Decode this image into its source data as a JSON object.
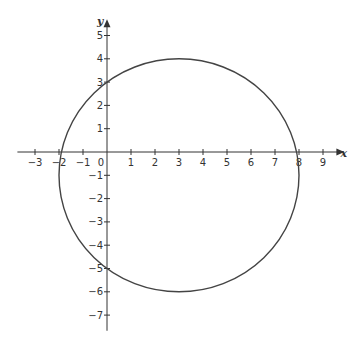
{
  "chart_data": {
    "type": "line",
    "title": "",
    "xlabel": "x",
    "ylabel": "y",
    "xlim": [
      -3.4,
      9.6
    ],
    "ylim": [
      -7.5,
      5.4
    ],
    "grid": false,
    "legend": null,
    "x_ticks": [
      -3,
      -2,
      -1,
      0,
      1,
      2,
      3,
      4,
      5,
      6,
      7,
      8,
      9
    ],
    "x_tick_labels": [
      "−3",
      "−2",
      "−1",
      "0",
      "1",
      "2",
      "3",
      "4",
      "5",
      "6",
      "7",
      "8",
      "9"
    ],
    "y_ticks": [
      5,
      4,
      3,
      2,
      1,
      -1,
      -2,
      -3,
      -4,
      -5,
      -6,
      -7
    ],
    "y_tick_labels": [
      "5",
      "4",
      "3",
      "2",
      "1",
      "−1",
      "−2",
      "−3",
      "−4",
      "−5",
      "−6",
      "−7"
    ],
    "series": [
      {
        "name": "circle",
        "shape": "circle",
        "center": [
          3,
          -1
        ],
        "radius": 5,
        "equation": "(x − 3)² + (y + 1)² = 25",
        "color": "#444444"
      }
    ],
    "key_points": {
      "x_intercepts": [
        -2,
        8
      ],
      "y_intercepts": [
        3,
        -5
      ],
      "top": [
        3,
        4
      ],
      "bottom": [
        3,
        -6
      ]
    }
  },
  "style": {
    "axis_color": "#333333",
    "curve_color": "#444444",
    "background": "#ffffff"
  },
  "layout": {
    "origin_px": [
      107,
      152
    ],
    "unit_x_px": 24,
    "unit_y_px": 23.3
  }
}
